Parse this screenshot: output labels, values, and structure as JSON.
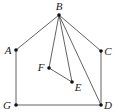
{
  "diagram": {
    "type": "graph",
    "nodes": [
      {
        "id": "B",
        "label": "B",
        "x": 59,
        "y": 15,
        "lx": 59,
        "ly": 10,
        "anchor": "middle"
      },
      {
        "id": "A",
        "label": "A",
        "x": 16,
        "y": 50,
        "lx": 8,
        "ly": 54,
        "anchor": "middle"
      },
      {
        "id": "C",
        "label": "C",
        "x": 101,
        "y": 51,
        "lx": 108,
        "ly": 55,
        "anchor": "middle"
      },
      {
        "id": "F",
        "label": "F",
        "x": 49,
        "y": 68,
        "lx": 41,
        "ly": 71,
        "anchor": "middle"
      },
      {
        "id": "E",
        "label": "E",
        "x": 72,
        "y": 82,
        "lx": 78,
        "ly": 91,
        "anchor": "middle"
      },
      {
        "id": "G",
        "label": "G",
        "x": 16,
        "y": 105,
        "lx": 7,
        "ly": 109,
        "anchor": "middle"
      },
      {
        "id": "D",
        "label": "D",
        "x": 101,
        "y": 105,
        "lx": 108,
        "ly": 109,
        "anchor": "middle"
      }
    ],
    "edges": [
      [
        "B",
        "A"
      ],
      [
        "B",
        "C"
      ],
      [
        "B",
        "F"
      ],
      [
        "B",
        "E"
      ],
      [
        "B",
        "D"
      ],
      [
        "F",
        "E"
      ],
      [
        "A",
        "G"
      ],
      [
        "C",
        "D"
      ],
      [
        "G",
        "D"
      ]
    ]
  }
}
